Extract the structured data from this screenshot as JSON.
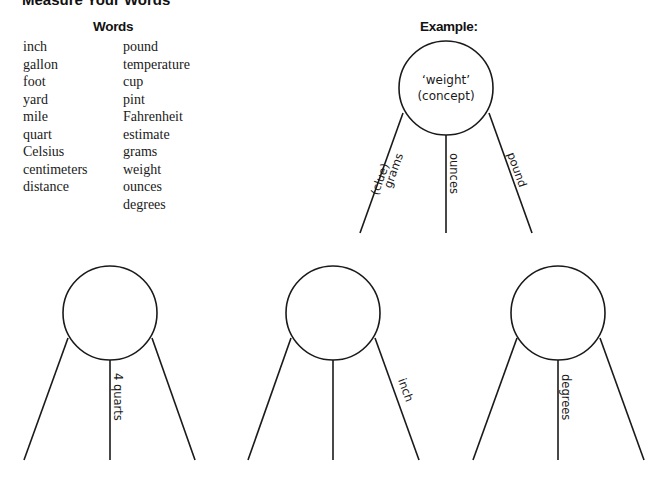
{
  "title": "Measure Your Words",
  "words": {
    "header": "Words",
    "column1": [
      "inch",
      "gallon",
      "foot",
      "yard",
      "mile",
      "quart",
      "Celsius",
      "centimeters",
      "distance"
    ],
    "column2": [
      "pound",
      "temperature",
      "cup",
      "pint",
      "Fahrenheit",
      "estimate",
      "grams",
      "weight",
      "ounces",
      "degrees"
    ]
  },
  "example": {
    "header": "Example:",
    "concept_line1": "‘weight’",
    "concept_line2": "(concept)",
    "left_label_a": "(clue)",
    "left_label_b": "grams",
    "center_label": "ounces",
    "right_label": "pound"
  },
  "diagrams": [
    {
      "concept": "",
      "left": "",
      "center": "4 quarts",
      "right": ""
    },
    {
      "concept": "",
      "left": "",
      "center": "",
      "right": "inch"
    },
    {
      "concept": "",
      "left": "",
      "center": "degrees",
      "right": ""
    }
  ],
  "colors": {
    "ink": "#1a1a1a",
    "background": "#ffffff"
  }
}
